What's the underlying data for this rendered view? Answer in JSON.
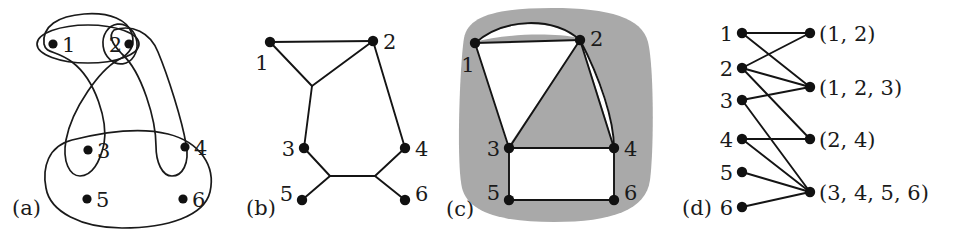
{
  "figure": {
    "caption_a": "(a)",
    "caption_b": "(b)",
    "caption_c": "(c)",
    "caption_d": "(d)",
    "background_color": "#ffffff",
    "ink_color": "#141414",
    "blob_color": "#a9a9a9"
  },
  "panel_a": {
    "name": "hypergraph-venn",
    "vertices": [
      {
        "id": "1",
        "label": "1"
      },
      {
        "id": "2",
        "label": "2"
      },
      {
        "id": "3",
        "label": "3"
      },
      {
        "id": "4",
        "label": "4"
      },
      {
        "id": "5",
        "label": "5"
      },
      {
        "id": "6",
        "label": "6"
      }
    ],
    "hyperedges": [
      {
        "id": "e1",
        "label": "(1, 2)"
      },
      {
        "id": "e2",
        "label": "(1, 2, 3)"
      },
      {
        "id": "e3",
        "label": "(2, 4)"
      },
      {
        "id": "e4",
        "label": "(3, 4, 5, 6)"
      }
    ]
  },
  "panel_b": {
    "name": "graph-drawing",
    "vertices": [
      {
        "id": "1",
        "label": "1"
      },
      {
        "id": "2",
        "label": "2"
      },
      {
        "id": "3",
        "label": "3"
      },
      {
        "id": "4",
        "label": "4"
      },
      {
        "id": "5",
        "label": "5"
      },
      {
        "id": "6",
        "label": "6"
      }
    ],
    "edges": [
      [
        "1",
        "2"
      ],
      [
        "1",
        "j1"
      ],
      [
        "2",
        "j1"
      ],
      [
        "j1",
        "3"
      ],
      [
        "2",
        "4"
      ],
      [
        "3",
        "j2"
      ],
      [
        "5",
        "j2"
      ],
      [
        "j2",
        "j3"
      ],
      [
        "4",
        "j3"
      ],
      [
        "6",
        "j3"
      ]
    ]
  },
  "panel_c": {
    "name": "planar-graph-shaded",
    "vertices": [
      {
        "id": "1",
        "label": "1"
      },
      {
        "id": "2",
        "label": "2"
      },
      {
        "id": "3",
        "label": "3"
      },
      {
        "id": "4",
        "label": "4"
      },
      {
        "id": "5",
        "label": "5"
      },
      {
        "id": "6",
        "label": "6"
      }
    ],
    "edges": [
      [
        "1",
        "2"
      ],
      [
        "1",
        "2"
      ],
      [
        "1",
        "3"
      ],
      [
        "2",
        "3"
      ],
      [
        "2",
        "4"
      ],
      [
        "2",
        "4"
      ],
      [
        "3",
        "4"
      ],
      [
        "3",
        "5"
      ],
      [
        "4",
        "6"
      ],
      [
        "5",
        "6"
      ]
    ]
  },
  "panel_d": {
    "name": "bipartite-incidence-graph",
    "left_vertices": [
      {
        "id": "1",
        "label": "1"
      },
      {
        "id": "2",
        "label": "2"
      },
      {
        "id": "3",
        "label": "3"
      },
      {
        "id": "4",
        "label": "4"
      },
      {
        "id": "5",
        "label": "5"
      },
      {
        "id": "6",
        "label": "6"
      }
    ],
    "right_vertices": [
      {
        "id": "e1",
        "label": "(1, 2)"
      },
      {
        "id": "e2",
        "label": "(1, 2, 3)"
      },
      {
        "id": "e3",
        "label": "(2, 4)"
      },
      {
        "id": "e4",
        "label": "(3, 4, 5, 6)"
      }
    ],
    "edges": [
      [
        "1",
        "e1"
      ],
      [
        "1",
        "e2"
      ],
      [
        "2",
        "e1"
      ],
      [
        "2",
        "e2"
      ],
      [
        "2",
        "e3"
      ],
      [
        "3",
        "e2"
      ],
      [
        "3",
        "e4"
      ],
      [
        "4",
        "e3"
      ],
      [
        "4",
        "e4"
      ],
      [
        "5",
        "e4"
      ],
      [
        "6",
        "e4"
      ]
    ]
  }
}
